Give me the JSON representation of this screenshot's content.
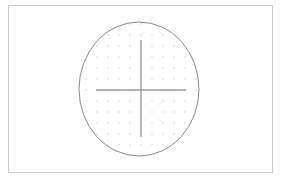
{
  "figure": {
    "title": "",
    "width": 282,
    "height": 180,
    "background_color": "#ffffff"
  },
  "frame": {
    "name": "outer-border",
    "x": 8,
    "y": 5,
    "width": 264,
    "height": 167,
    "stroke_color": "#c9c9c9",
    "stroke_width": 1,
    "fill": "none"
  },
  "chart_data": {
    "type": "scatter",
    "title": "",
    "subtitle": "",
    "xlabel": "",
    "ylabel": "",
    "grid": true,
    "legend": null,
    "legend_position": "none",
    "xlim": [
      -5.5,
      5.5
    ],
    "ylim": [
      -6.0,
      6.0
    ],
    "xticks": [],
    "yticks": [],
    "tick_labels_shown": false,
    "shapes": [
      {
        "name": "ellipse-outline",
        "type": "ellipse",
        "cx": 139,
        "cy": 89,
        "rx": 60,
        "ry": 67,
        "stroke_color": "#8a8a8a",
        "stroke_width": 1,
        "fill": "none"
      },
      {
        "name": "crosshair-horizontal",
        "type": "line",
        "x1": 96,
        "y1": 90,
        "x2": 186,
        "y2": 90,
        "stroke_color": "#9b9b9b",
        "stroke_width": 1.4
      },
      {
        "name": "crosshair-vertical",
        "type": "line",
        "x1": 141,
        "y1": 40,
        "x2": 141,
        "y2": 137,
        "stroke_color": "#9b9b9b",
        "stroke_width": 1.4
      }
    ],
    "dot_grid": {
      "name": "interior-dot-grid",
      "color": "#e3e3e6",
      "dot_radius": 0.9,
      "spacing_x": 11,
      "spacing_y": 11,
      "origin_x": 141,
      "origin_y": 90,
      "clipped_to": "ellipse-outline",
      "columns": 11,
      "rows": 13
    }
  }
}
